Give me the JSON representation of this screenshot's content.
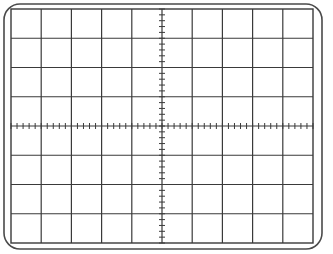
{
  "graticule": {
    "title": "Oscilloscope graticule",
    "columns": 10,
    "rows": 8,
    "minor_ticks_per_division": 5,
    "colors": {
      "background": "#ffffff",
      "line": "#3a3a3a",
      "border": "#4a4a4a"
    },
    "frame": {
      "x": 4,
      "y": 4,
      "width": 318,
      "height": 245,
      "radius": 16
    },
    "grid": {
      "x": 11,
      "y": 9,
      "width": 302,
      "height": 234
    }
  }
}
